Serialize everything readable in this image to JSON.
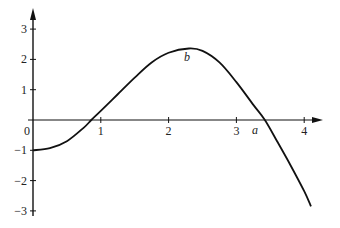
{
  "chart_data": {
    "type": "line",
    "title": "",
    "xlabel": "",
    "ylabel": "",
    "xlim": [
      0,
      4.2
    ],
    "ylim": [
      -3.2,
      3.4
    ],
    "grid": false,
    "x_ticks": [
      "0",
      "1",
      "2",
      "3",
      "4"
    ],
    "y_ticks": [
      "3",
      "2",
      "1",
      "-1",
      "-2",
      "-3"
    ],
    "annotations": [
      {
        "label": "a",
        "x": 3.42,
        "y": 0,
        "note": "x-intercept"
      },
      {
        "label": "b",
        "x": 2.3,
        "y": 2.35,
        "note": "local maximum"
      }
    ],
    "series": [
      {
        "name": "f(x)",
        "x": [
          0,
          0.25,
          0.5,
          0.75,
          0.86,
          1.0,
          1.25,
          1.5,
          1.75,
          2.0,
          2.3,
          2.5,
          2.75,
          3.0,
          3.25,
          3.42,
          3.6,
          3.8,
          4.0,
          4.1
        ],
        "y": [
          -1.0,
          -0.93,
          -0.7,
          -0.25,
          0.0,
          0.3,
          0.85,
          1.4,
          1.9,
          2.22,
          2.36,
          2.28,
          1.9,
          1.25,
          0.5,
          0.0,
          -0.7,
          -1.5,
          -2.35,
          -2.85
        ]
      }
    ]
  }
}
